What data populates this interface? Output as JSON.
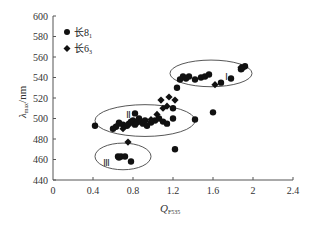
{
  "chart_data": {
    "type": "scatter",
    "title": "",
    "xlabel": "Q_F535",
    "xlabel_main": "Q",
    "xlabel_sub": "F535",
    "ylabel": "λmax/nm",
    "ylabel_main": "λ",
    "ylabel_sub": "max",
    "ylabel_unit": "/nm",
    "xlim": [
      0,
      2.4
    ],
    "ylim": [
      440,
      600
    ],
    "xticks": [
      0,
      0.4,
      0.8,
      1.2,
      1.6,
      2,
      2.4
    ],
    "xtick_labels": [
      "0",
      "0.4",
      "0.8",
      "1.2",
      "1.6",
      "2",
      "2.4"
    ],
    "yticks": [
      440,
      460,
      480,
      500,
      520,
      540,
      560,
      580,
      600
    ],
    "ytick_labels": [
      "440",
      "460",
      "480",
      "500",
      "520",
      "540",
      "560",
      "580",
      "600"
    ],
    "grid": false,
    "legend_position": "upper-left",
    "legend": [
      {
        "name": "长8₁",
        "marker": "circle"
      },
      {
        "name": "长6₃",
        "marker": "diamond"
      }
    ],
    "series": [
      {
        "name": "长8₁",
        "marker": "circle",
        "points": [
          [
            0.65,
            463
          ],
          [
            0.66,
            462
          ],
          [
            0.68,
            463
          ],
          [
            0.72,
            463
          ],
          [
            0.78,
            458
          ],
          [
            0.42,
            493
          ],
          [
            0.6,
            490
          ],
          [
            0.63,
            492
          ],
          [
            0.66,
            496
          ],
          [
            0.7,
            494
          ],
          [
            0.74,
            493
          ],
          [
            0.76,
            495
          ],
          [
            0.78,
            497
          ],
          [
            0.8,
            498
          ],
          [
            0.82,
            494
          ],
          [
            0.84,
            496
          ],
          [
            0.86,
            500
          ],
          [
            0.88,
            497
          ],
          [
            0.9,
            495
          ],
          [
            0.92,
            498
          ],
          [
            0.94,
            493
          ],
          [
            0.98,
            496
          ],
          [
            1.02,
            498
          ],
          [
            1.06,
            500
          ],
          [
            1.1,
            497
          ],
          [
            1.14,
            495
          ],
          [
            1.2,
            500
          ],
          [
            1.42,
            499
          ],
          [
            0.82,
            505
          ],
          [
            1.2,
            510
          ],
          [
            1.22,
            470
          ],
          [
            1.6,
            506
          ],
          [
            1.24,
            530
          ],
          [
            1.27,
            538
          ],
          [
            1.3,
            541
          ],
          [
            1.33,
            539
          ],
          [
            1.36,
            541
          ],
          [
            1.42,
            538
          ],
          [
            1.48,
            540
          ],
          [
            1.52,
            541
          ],
          [
            1.56,
            543
          ],
          [
            1.68,
            535
          ],
          [
            1.78,
            539
          ],
          [
            1.88,
            548
          ],
          [
            1.92,
            551
          ]
        ]
      },
      {
        "name": "长6₃",
        "marker": "diamond",
        "points": [
          [
            0.75,
            477
          ],
          [
            0.64,
            493
          ],
          [
            0.7,
            490
          ],
          [
            0.98,
            499
          ],
          [
            1.04,
            504
          ],
          [
            1.08,
            518
          ],
          [
            1.16,
            521
          ],
          [
            1.14,
            512
          ],
          [
            1.22,
            518
          ],
          [
            1.1,
            510
          ],
          [
            1.62,
            533
          ],
          [
            1.88,
            550
          ],
          [
            1.9,
            549
          ]
        ]
      }
    ],
    "annotations": [
      {
        "label": "Ⅰ",
        "x": 1.73,
        "y": 541,
        "note": "region I ellipse",
        "center": [
          1.58,
          544
        ],
        "rx": 0.41,
        "ry": 13
      },
      {
        "label": "Ⅱ",
        "x": 0.75,
        "y": 504,
        "note": "region II ellipse",
        "center": [
          0.92,
          498
        ],
        "rx": 0.5,
        "ry": 15.5
      },
      {
        "label": "Ⅲ",
        "x": 0.53,
        "y": 458,
        "note": "region III ellipse",
        "center": [
          0.7,
          463
        ],
        "rx": 0.28,
        "ry": 13
      }
    ]
  },
  "legend": {
    "item1": "长8",
    "item1_sub": "1",
    "item2": "长6",
    "item2_sub": "3"
  },
  "regions": {
    "r1": "Ⅰ",
    "r2": "Ⅱ",
    "r3": "Ⅲ"
  }
}
